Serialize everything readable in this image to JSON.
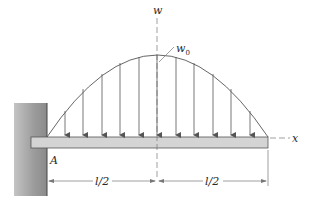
{
  "diagram": {
    "type": "cantilever beam with parabolic distributed load",
    "labels": {
      "vertical_axis": "w",
      "peak_load": "w",
      "peak_load_subscript": "0",
      "horizontal_axis": "x",
      "support_point": "A",
      "left_span": "l/2",
      "right_span": "l/2"
    },
    "load": {
      "shape": "parabolic",
      "arrow_count": 11,
      "arrow_x": [
        65,
        83,
        102,
        120,
        139,
        157,
        176,
        194,
        213,
        231,
        250
      ]
    },
    "colors": {
      "wall": "#9a9a9a",
      "beam_fill": "#d4d4d4",
      "beam_stroke": "#555555",
      "lines": "#555555"
    }
  }
}
